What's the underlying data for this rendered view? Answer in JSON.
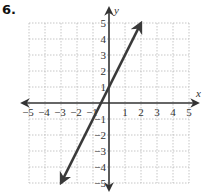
{
  "problem": {
    "label": "6."
  },
  "chart_data": {
    "type": "line",
    "title": "",
    "xlabel": "x",
    "ylabel": "y",
    "xlim": [
      -5,
      5
    ],
    "ylim": [
      -5,
      5
    ],
    "grid": true,
    "x_ticks": [
      -5,
      -4,
      -3,
      -2,
      -1,
      1,
      2,
      3,
      4,
      5
    ],
    "y_ticks": [
      -5,
      -4,
      -3,
      -2,
      -1,
      1,
      2,
      3,
      4,
      5
    ],
    "series": [
      {
        "name": "y = 2x + 1",
        "equation": "y = 2x + 1",
        "slope": 2,
        "y_intercept": 1,
        "x": [
          -3,
          -0.5,
          0,
          2
        ],
        "y": [
          -5,
          0,
          1,
          5
        ],
        "arrows_both_ends": true
      }
    ]
  },
  "style": {
    "line_color": "#3a3a3a",
    "axis_color": "#333333",
    "grid_color": "#b8b8b8"
  }
}
